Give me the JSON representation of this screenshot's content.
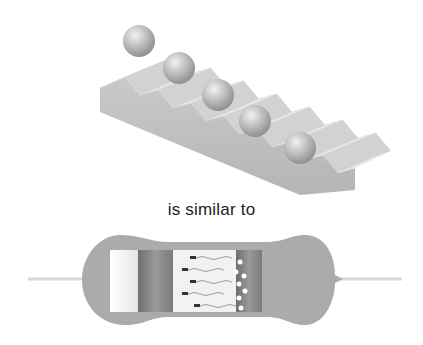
{
  "figure": {
    "top_panel": {
      "subject": "balls-on-staircase",
      "ball_count": 5
    },
    "caption": "is similar to",
    "bottom_panel": {
      "subject": "resistor-cutaway"
    }
  },
  "colors": {
    "stair_top": "#e6e6e6",
    "stair_riser": "#cfcfcf",
    "stair_side": "#bdbdbd",
    "ball": "#b4b4b4",
    "resistor_body": "#a9a9a9",
    "lead_wire": "#d8d8d8",
    "caption_text": "#222222"
  }
}
